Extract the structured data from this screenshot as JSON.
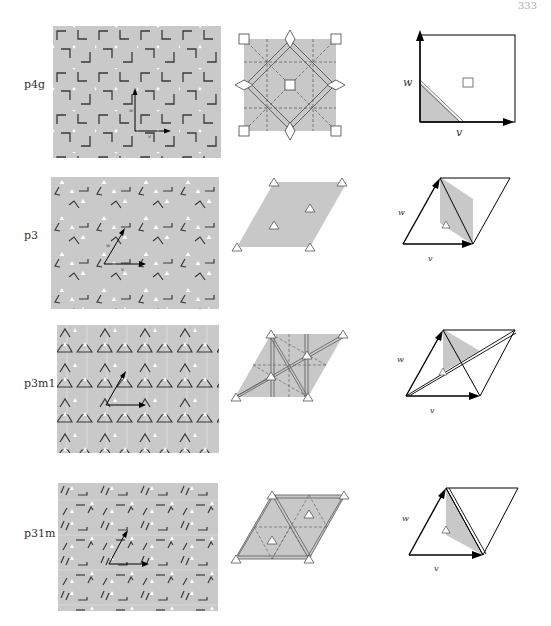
{
  "page": {
    "number": "333"
  },
  "colors": {
    "pattern_bg": "#c9c9c9",
    "cell_fill": "#c8c8c8",
    "domain_fill": "#c8c8c8",
    "motif": "#3a3a3a",
    "arrow": "#000000",
    "rotation_marker": "#ffffff"
  },
  "rows": [
    {
      "label": "p4g",
      "lattice": "square",
      "vector_v": "v",
      "vector_w": "w",
      "rotation_center": "square (4-fold)"
    },
    {
      "label": "p3",
      "lattice": "hexagonal",
      "vector_v": "v",
      "vector_w": "w",
      "rotation_center": "triangle (3-fold)"
    },
    {
      "label": "p3m1",
      "lattice": "hexagonal",
      "vector_v": "v",
      "vector_w": "w",
      "rotation_center": "triangle (3-fold)"
    },
    {
      "label": "p31m",
      "lattice": "hexagonal",
      "vector_v": "v",
      "vector_w": "w",
      "rotation_center": "triangle (3-fold)"
    }
  ]
}
